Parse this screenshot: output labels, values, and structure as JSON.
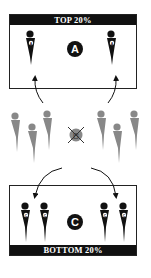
{
  "top_zone": {
    "label": "TOP 20%",
    "group_letter": "A",
    "player_marker": "A"
  },
  "middle_zone": {
    "group_letter": "B",
    "status": "crossed-out"
  },
  "bottom_zone": {
    "label": "BOTTOM 20%",
    "group_letter": "C",
    "player_marker": "C"
  },
  "colors": {
    "dark": "#111111",
    "gray": "#888888",
    "background": "#ffffff"
  }
}
